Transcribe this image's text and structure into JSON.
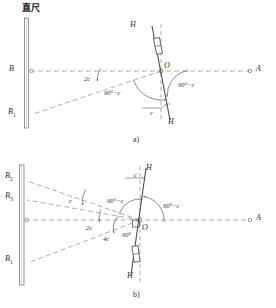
{
  "figure": {
    "title_cn": "直尺",
    "title_cn_meaning": "straight ruler",
    "panels": [
      {
        "id": "a",
        "caption": "a)",
        "points": {
          "A": "A",
          "B": "B",
          "B1": "B",
          "B1_sub": "1",
          "O": "O",
          "H_top": "H",
          "H_bottom": "H"
        },
        "angles": [
          {
            "name": "two-c",
            "label": "2c"
          },
          {
            "name": "ninety-minus-c-left",
            "label": "90°−c"
          },
          {
            "name": "ninety-minus-c-right",
            "label": "90°−c"
          },
          {
            "name": "c-lower",
            "label": "c"
          }
        ]
      },
      {
        "id": "b",
        "caption": "b)",
        "points": {
          "A": "A",
          "B1": "B",
          "B1_sub": "1",
          "B2": "B",
          "B2_sub": "2",
          "B3": "B",
          "B3_sub": "3",
          "O": "O",
          "H_top": "H",
          "H_bottom": "H"
        },
        "angles": [
          {
            "name": "c-upper",
            "label": "c"
          },
          {
            "name": "two-c",
            "label": "2c"
          },
          {
            "name": "four-c",
            "label": "4c"
          },
          {
            "name": "ninety",
            "label": "90°"
          },
          {
            "name": "ninety-minus-c-left",
            "label": "90°−c"
          },
          {
            "name": "ninety-minus-c-right",
            "label": "90°−c"
          },
          {
            "name": "c-top",
            "label": "c"
          }
        ]
      }
    ],
    "colors": {
      "line": "#4a4a4a",
      "dashed": "#8a8a8a",
      "ruler": "#6a6a6a",
      "text": "#2b2b2b"
    }
  }
}
